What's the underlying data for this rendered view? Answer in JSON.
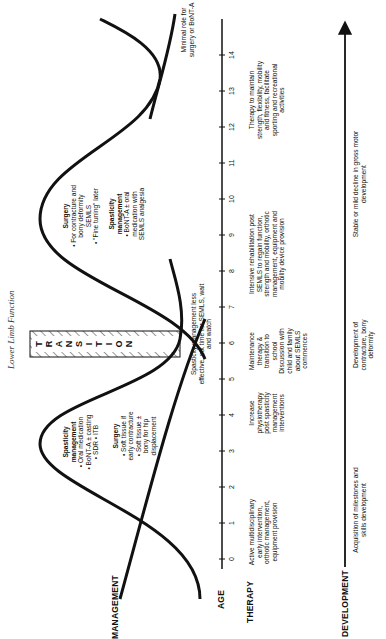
{
  "running_head": "Lower Limb Function",
  "row_labels": {
    "management": "MANAGEMENT",
    "age": "AGE",
    "therapy": "THERAPY",
    "development": "DEVELOPMENT"
  },
  "transition": {
    "letters": [
      "T",
      "R",
      "A",
      "N",
      "S",
      "I",
      "T",
      "I",
      "O",
      "N"
    ],
    "label": "TRANSITION"
  },
  "management": {
    "early_peak": {
      "spasticity_title": "Spasticity management",
      "spasticity_items": [
        "Oral medication",
        "BoNT-A ± casting",
        "SDR",
        "ITB"
      ],
      "surgery_title": "Surgery",
      "surgery_items": [
        "Soft tissue if early contracture",
        "Soft tissue ± bony for hip displacement"
      ]
    },
    "late_peak": {
      "surgery_title": "Surgery",
      "surgery_items": [
        "For contracture and bony deformity SEMLS",
        "\"Fine tuning\" later"
      ],
      "spasticity_title": "Spasticity management",
      "spasticity_items": [
        "BoNT-A ± oral medication with SEMLS analgesia"
      ]
    },
    "wait_note": "Spasticity management less effective, not time for SEMLS, wait and watch",
    "minimal_note": "Minimal role for surgery or BoNT-A"
  },
  "age_axis": {
    "ticks": [
      "0",
      "1",
      "2",
      "3",
      "4",
      "5",
      "6",
      "7",
      "8",
      "9",
      "10",
      "11",
      "12",
      "13",
      "14"
    ]
  },
  "therapy": [
    {
      "text": "Active multidisciplinary early intervention, orthotic management, equipment provision"
    },
    {
      "text": "Increase physiotherapy post spasticity management interventions"
    },
    {
      "text": "Maintenance therapy & transition to school Discussion with child and family about SEMLS commences"
    },
    {
      "text": "Intensive rehabilitation post SEMLS to regain function, strength and mobility, orthotic management, equipment and mobility device provision"
    },
    {
      "text": "Therapy to maintain strength, flexibility, mobility and fitness, facilitate sporting and recreational activities"
    }
  ],
  "development": [
    {
      "text": "Acquisition of milestones and skills development"
    },
    {
      "text": "Development of contracture, bony deformity"
    },
    {
      "text": "Stable or mild decline in gross motor development"
    }
  ]
}
